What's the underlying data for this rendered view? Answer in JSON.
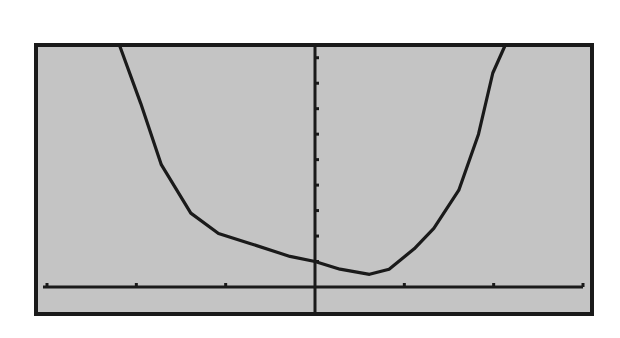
{
  "colors": {
    "page_background": "#ffffff",
    "screen_background": "#c4c4c4",
    "ink": "#1a1a1a"
  },
  "screen": {
    "frame": {
      "left": 36,
      "top": 45,
      "right": 592,
      "bottom": 314
    },
    "axes_pixels": {
      "origin_x": 315,
      "origin_y": 287,
      "x_axis_left": 43,
      "x_axis_right": 583
    }
  },
  "chart_data": {
    "type": "line",
    "title": "",
    "xlabel": "",
    "ylabel": "",
    "grid": false,
    "legend": null,
    "xlim": [
      -3,
      3
    ],
    "ylim": [
      -1,
      10
    ],
    "x_tick_step": 1,
    "y_tick_step": 1,
    "x_ticks": [
      -3,
      -2,
      -1,
      1,
      2,
      3
    ],
    "y_ticks": [
      1,
      2,
      3,
      4,
      5,
      6,
      7,
      8,
      9
    ],
    "x_tick_labels": [],
    "y_tick_labels": [],
    "series": [
      {
        "name": "curve",
        "description": "U-shaped curve, steep descent from upper left, flattening near y-axis, minimum slightly right of origin, steep rise at right",
        "points": [
          [
            -2.19,
            10.0
          ],
          [
            -1.95,
            7.2
          ],
          [
            -1.72,
            4.8
          ],
          [
            -1.39,
            2.9
          ],
          [
            -1.08,
            2.1
          ],
          [
            -0.72,
            1.7
          ],
          [
            -0.28,
            1.2
          ],
          [
            0.0,
            1.0
          ],
          [
            0.28,
            0.7
          ],
          [
            0.61,
            0.5
          ],
          [
            0.83,
            0.7
          ],
          [
            1.11,
            1.5
          ],
          [
            1.33,
            2.3
          ],
          [
            1.61,
            3.8
          ],
          [
            1.83,
            6.0
          ],
          [
            1.99,
            8.4
          ],
          [
            2.13,
            10.0
          ]
        ],
        "minimum": {
          "x": 0.6,
          "y": 0.5
        },
        "y_intercept": 1.0
      }
    ]
  }
}
